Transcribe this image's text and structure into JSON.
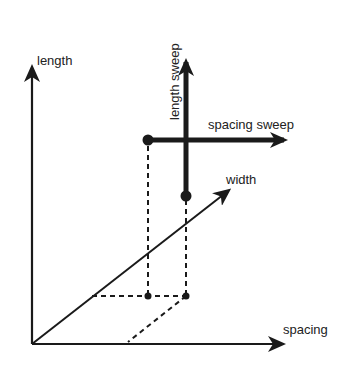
{
  "diagram": {
    "axes": {
      "vertical_label": "length",
      "horizontal_label": "spacing",
      "diagonal_label": "width"
    },
    "sweeps": {
      "vertical_label": "length sweep",
      "horizontal_label": "spacing sweep"
    },
    "colors": {
      "ink": "#1a1a1a",
      "background": "#ffffff"
    }
  }
}
